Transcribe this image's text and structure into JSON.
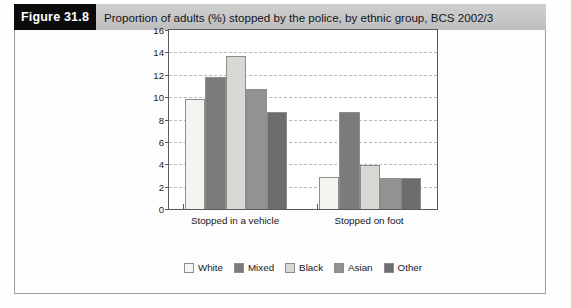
{
  "figure": {
    "tag": "Figure 31.8",
    "caption": "Proportion of adults (%) stopped by the police, by ethnic group, BCS 2002/3"
  },
  "chart_data": {
    "type": "bar",
    "title": "Proportion of adults (%) stopped by the police, by ethnic group, BCS 2002/3",
    "xlabel": "",
    "ylabel": "",
    "ylim": [
      0,
      16
    ],
    "yticks": [
      0,
      2,
      4,
      6,
      8,
      10,
      12,
      14,
      16
    ],
    "grid": true,
    "legend_position": "bottom",
    "categories": [
      "Stopped in a vehicle",
      "Stopped on foot"
    ],
    "series": [
      {
        "name": "White",
        "color": "#f4f4f1",
        "values": [
          9.8,
          2.9
        ]
      },
      {
        "name": "Mixed",
        "color": "#7b7b7b",
        "values": [
          11.8,
          8.7
        ]
      },
      {
        "name": "Black",
        "color": "#d7d7d4",
        "values": [
          13.7,
          3.9
        ]
      },
      {
        "name": "Asian",
        "color": "#929292",
        "values": [
          10.7,
          2.75
        ]
      },
      {
        "name": "Other",
        "color": "#6d6d6d",
        "values": [
          8.7,
          2.8
        ]
      }
    ]
  }
}
